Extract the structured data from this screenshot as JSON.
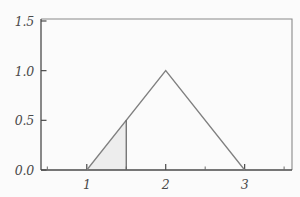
{
  "chart_data": {
    "type": "line",
    "title": "",
    "xlabel": "",
    "ylabel": "",
    "xlim": [
      0.42,
      3.6
    ],
    "ylim": [
      0.0,
      1.52
    ],
    "grid": false,
    "legend": null,
    "xticks": [
      1,
      2,
      3
    ],
    "xtick_labels": [
      "1",
      "2",
      "3"
    ],
    "yticks": [
      0.0,
      0.5,
      1.0,
      1.5
    ],
    "ytick_labels": [
      "0.0",
      "0.5",
      "1.0",
      "1.5"
    ],
    "minor_xticks": [
      0.5,
      1.5,
      2.5,
      3.5
    ],
    "series": [
      {
        "name": "triangular-pdf",
        "type": "line",
        "color": "#808080",
        "x": [
          1.0,
          2.0,
          3.0
        ],
        "values": [
          0.0,
          1.0,
          0.0
        ]
      },
      {
        "name": "vertical-marker-at-1.5",
        "type": "line",
        "color": "#606060",
        "x": [
          1.5,
          1.5
        ],
        "values": [
          0.0,
          0.5
        ]
      }
    ],
    "shaded_region": {
      "name": "area-under-curve-1-to-1.5",
      "fill_color": "#ededed",
      "edge_color": "#808080",
      "x_range": [
        1.0,
        1.5
      ],
      "polygon_x": [
        1.0,
        1.5,
        1.5
      ],
      "polygon_y": [
        0.0,
        0.5,
        0.0
      ]
    },
    "annotations": []
  },
  "figure": {
    "background_color": "#fbfbfb",
    "axis_color": "#4a4a4a",
    "line_color": "#808080",
    "tick_label_color": "#4a4a4a"
  }
}
